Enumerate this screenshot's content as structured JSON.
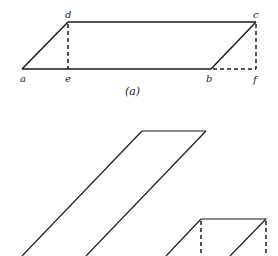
{
  "figure_a": {
    "caption": "(a)",
    "points": {
      "a": {
        "label": "a",
        "x": 22,
        "y": 69
      },
      "e": {
        "label": "e",
        "x": 68,
        "y": 69
      },
      "b": {
        "label": "b",
        "x": 211,
        "y": 69
      },
      "f": {
        "label": "f",
        "x": 256,
        "y": 69
      },
      "d": {
        "label": "d",
        "x": 68,
        "y": 22
      },
      "c": {
        "label": "c",
        "x": 256,
        "y": 22
      }
    },
    "solid_edges": [
      "a-b",
      "b-c",
      "c-d",
      "d-a"
    ],
    "dashed_edges": [
      "d-e",
      "c-f",
      "b-f"
    ]
  },
  "figure_b": {
    "tall_parallelogram": {
      "top_left": [
        142,
        131
      ],
      "top_right": [
        206,
        131
      ],
      "bottom_left": [
        22,
        256
      ],
      "bottom_right": [
        86,
        256
      ]
    },
    "small_shape": {
      "top_left": [
        201,
        219
      ],
      "top_right": [
        266,
        219
      ],
      "dashed_verticals_x": [
        201,
        266
      ]
    }
  },
  "colors": {
    "stroke": "#1a1a1a",
    "background": "#ffffff"
  }
}
